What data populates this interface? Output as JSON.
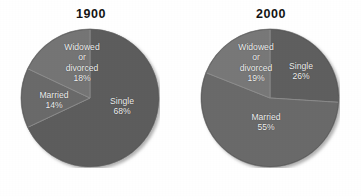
{
  "figure": {
    "background_color": "#ffffff",
    "label_text_color": "#f2f2f2",
    "title_text_color": "#151515"
  },
  "chart_data": [
    {
      "type": "pie",
      "title": "1900",
      "xlabel": "",
      "ylabel": "",
      "legend": "none",
      "grid": false,
      "start_angle_deg": 0,
      "direction": "clockwise",
      "categories": [
        "Single",
        "Widowed or divorced",
        "Married"
      ],
      "values": [
        68,
        14,
        18
      ],
      "slices": [
        {
          "name": "Single",
          "label_line1": "Single",
          "label_line2": "",
          "label_line3": "",
          "value": 68,
          "percent_label": "68%",
          "color": "#5d5d5d",
          "start_deg": 0,
          "end_deg": 244.8
        },
        {
          "name": "Married",
          "label_line1": "Married",
          "label_line2": "",
          "label_line3": "",
          "value": 14,
          "percent_label": "14%",
          "color": "#6b6b6b",
          "start_deg": 244.8,
          "end_deg": 295.2
        },
        {
          "name": "Widowed or divorced",
          "label_line1": "Widowed",
          "label_line2": "or",
          "label_line3": "divorced",
          "value": 18,
          "percent_label": "18%",
          "color": "#757575",
          "start_deg": 295.2,
          "end_deg": 360
        }
      ]
    },
    {
      "type": "pie",
      "title": "2000",
      "xlabel": "",
      "ylabel": "",
      "legend": "none",
      "grid": false,
      "start_angle_deg": 0,
      "direction": "clockwise",
      "categories": [
        "Single",
        "Married",
        "Widowed or divorced"
      ],
      "values": [
        26,
        55,
        19
      ],
      "slices": [
        {
          "name": "Single",
          "label_line1": "Single",
          "label_line2": "",
          "label_line3": "",
          "value": 26,
          "percent_label": "26%",
          "color": "#5e5e5e",
          "start_deg": 0,
          "end_deg": 93.6
        },
        {
          "name": "Married",
          "label_line1": "Married",
          "label_line2": "",
          "label_line3": "",
          "value": 55,
          "percent_label": "55%",
          "color": "#6a6a6a",
          "start_deg": 93.6,
          "end_deg": 291.6
        },
        {
          "name": "Widowed or divorced",
          "label_line1": "Widowed",
          "label_line2": "or",
          "label_line3": "divorced",
          "value": 19,
          "percent_label": "19%",
          "color": "#787878",
          "start_deg": 291.6,
          "end_deg": 360
        }
      ]
    }
  ]
}
